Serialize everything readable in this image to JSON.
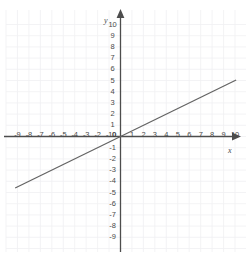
{
  "chart_data": {
    "type": "line",
    "title": "",
    "xlabel": "x",
    "ylabel": "y",
    "xlim": [
      -10,
      10
    ],
    "ylim": [
      -10,
      10
    ],
    "grid": true,
    "grid_spacing": 1,
    "legend": "none",
    "x_ticks": [
      "-9",
      "-8",
      "-7",
      "-6",
      "-5",
      "-4",
      "-3",
      "-2",
      "-1",
      "1",
      "2",
      "3",
      "4",
      "5",
      "6",
      "7",
      "8",
      "9",
      "10"
    ],
    "y_ticks": [
      "10",
      "9",
      "8",
      "7",
      "6",
      "5",
      "4",
      "3",
      "2",
      "1",
      "-1",
      "-2",
      "-3",
      "-4",
      "-5",
      "-6",
      "-7",
      "-8",
      "-9"
    ],
    "origin_label": "0",
    "series": [
      {
        "name": "line",
        "equation": "y = 0.5x",
        "slope": 0.5,
        "intercept": 0,
        "color": "#646464",
        "x": [
          -9.2,
          10.1
        ],
        "values": [
          -4.6,
          5.05
        ]
      }
    ],
    "axis_color": "#4d4d4d",
    "grid_color": "#f0f0f3",
    "background": "#ffffff"
  },
  "axes": {
    "x_name": "x",
    "y_name": "y"
  }
}
